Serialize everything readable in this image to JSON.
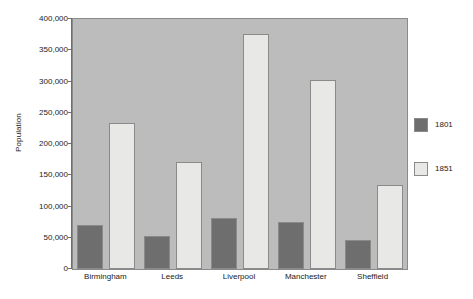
{
  "chart_data": {
    "type": "bar",
    "title": "",
    "xlabel": "",
    "ylabel": "Population",
    "categories": [
      "Birmingham",
      "Leeds",
      "Liverpool",
      "Manchester",
      "Sheffield"
    ],
    "series": [
      {
        "name": "1801",
        "color": "#6e6e6e",
        "values": [
          71000,
          53000,
          82000,
          75000,
          46000
        ]
      },
      {
        "name": "1851",
        "color": "#e8e8e6",
        "values": [
          233000,
          172000,
          376000,
          303000,
          135000
        ]
      }
    ],
    "ylim": [
      0,
      400000
    ],
    "ytick_values": [
      0,
      50000,
      100000,
      150000,
      200000,
      250000,
      300000,
      350000,
      400000
    ],
    "ytick_labels": [
      "0",
      "50,000",
      "100,000",
      "150,000",
      "200,000",
      "250,000",
      "300,000",
      "350,000",
      "400,000"
    ],
    "grid": false,
    "legend_position": "right",
    "plot_background": "#bcbcbc",
    "figure_background": "#ffffff",
    "axis_color": "#6e6e6e"
  }
}
